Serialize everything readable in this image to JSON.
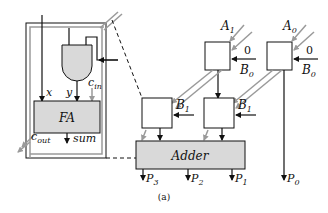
{
  "diagram": {
    "caption": "(a)",
    "full_adder_cell": {
      "block_label": "FA",
      "inputs": {
        "x": "x",
        "y": "y",
        "cin": "c",
        "cin_sub": "in"
      },
      "outputs": {
        "cout": "c",
        "cout_sub": "out",
        "sum": "sum"
      }
    },
    "top_cells": [
      {
        "a_label": "A",
        "a_sub": "1",
        "zero_label": "0",
        "b_label": "B",
        "b_sub": "0"
      },
      {
        "a_label": "A",
        "a_sub": "0",
        "zero_label": "0",
        "b_label": "B",
        "b_sub": "0"
      }
    ],
    "middle_cells": [
      {
        "b_label": "B",
        "b_sub": "1"
      },
      {
        "b_label": "B",
        "b_sub": "1"
      }
    ],
    "adder": {
      "label": "Adder"
    },
    "outputs": [
      {
        "label": "P",
        "sub": "3"
      },
      {
        "label": "P",
        "sub": "2"
      },
      {
        "label": "P",
        "sub": "1"
      },
      {
        "label": "P",
        "sub": "0"
      }
    ],
    "colors": {
      "stroke": "#111111",
      "gray_wire": "#9a9a9a",
      "fill_gray": "#d9d9d9",
      "background": "#ffffff"
    }
  }
}
